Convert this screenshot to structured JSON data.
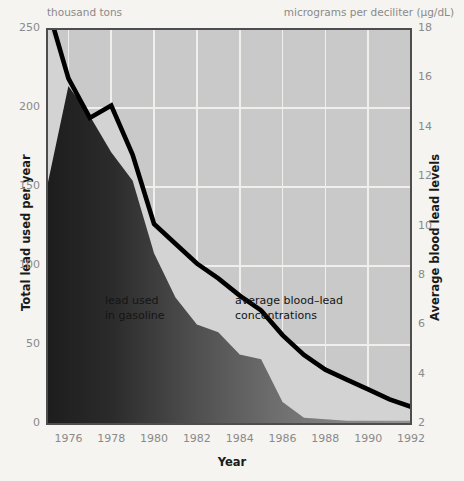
{
  "axes": {
    "left_unit": "thousand tons",
    "right_unit": "micrograms per deciliter (µg/dL)",
    "left_title": "Total lead used per year",
    "right_title": "Average blood lead levels",
    "x_title": "Year",
    "left_ticks": [
      "0",
      "50",
      "100",
      "150",
      "200",
      "250"
    ],
    "right_ticks": [
      "2",
      "4",
      "6",
      "8",
      "10",
      "12",
      "14",
      "16",
      "18"
    ],
    "x_ticks": [
      "1976",
      "1978",
      "1980",
      "1982",
      "1984",
      "1986",
      "1988",
      "1990",
      "1992"
    ]
  },
  "annotations": {
    "gasoline": "lead used\nin gasoline",
    "blood": "average blood–lead\nconcentrations"
  },
  "colors": {
    "page_background": "#f5f4f0",
    "plot_background": "#c9c9c9",
    "band_fill": "#d2d2d2",
    "area_dark": "#272727",
    "area_light": "#8f8f8f",
    "line": "#000000",
    "gridline": "#f0efec",
    "tick_text": "#8a8a8a",
    "title_text": "#1a1a1a"
  },
  "chart_data": {
    "type": "area",
    "title": "",
    "subtitle": "",
    "xlabel": "Year",
    "ylabel": "Total lead used per year",
    "y2label": "Average blood lead levels",
    "xlim": [
      1975,
      1992
    ],
    "ylim": [
      0,
      250
    ],
    "y2lim": [
      2,
      18
    ],
    "grid": true,
    "legend": "none",
    "x": [
      1976,
      1977,
      1978,
      1979,
      1980,
      1981,
      1982,
      1983,
      1984,
      1985,
      1986,
      1987,
      1988,
      1989,
      1990,
      1991,
      1992
    ],
    "series": [
      {
        "name": "lead used in gasoline",
        "axis": "left",
        "unit": "thousand tons",
        "render": "area",
        "values": [
          214,
          195,
          172,
          154,
          108,
          80,
          63,
          58,
          44,
          41,
          14,
          4,
          3,
          2,
          2,
          2,
          2
        ]
      },
      {
        "name": "average blood–lead concentrations",
        "axis": "right",
        "unit": "µg/dL",
        "render": "line",
        "values": [
          16.0,
          14.4,
          14.9,
          12.9,
          10.1,
          9.3,
          8.5,
          7.9,
          7.2,
          6.6,
          5.6,
          4.8,
          4.2,
          3.8,
          3.4,
          3.0,
          2.7
        ]
      }
    ],
    "annotations": [
      {
        "text": "lead used in gasoline",
        "x": 1979.5,
        "y": 85
      },
      {
        "text": "average blood–lead concentrations",
        "x": 1984.2,
        "y": 95
      }
    ]
  }
}
